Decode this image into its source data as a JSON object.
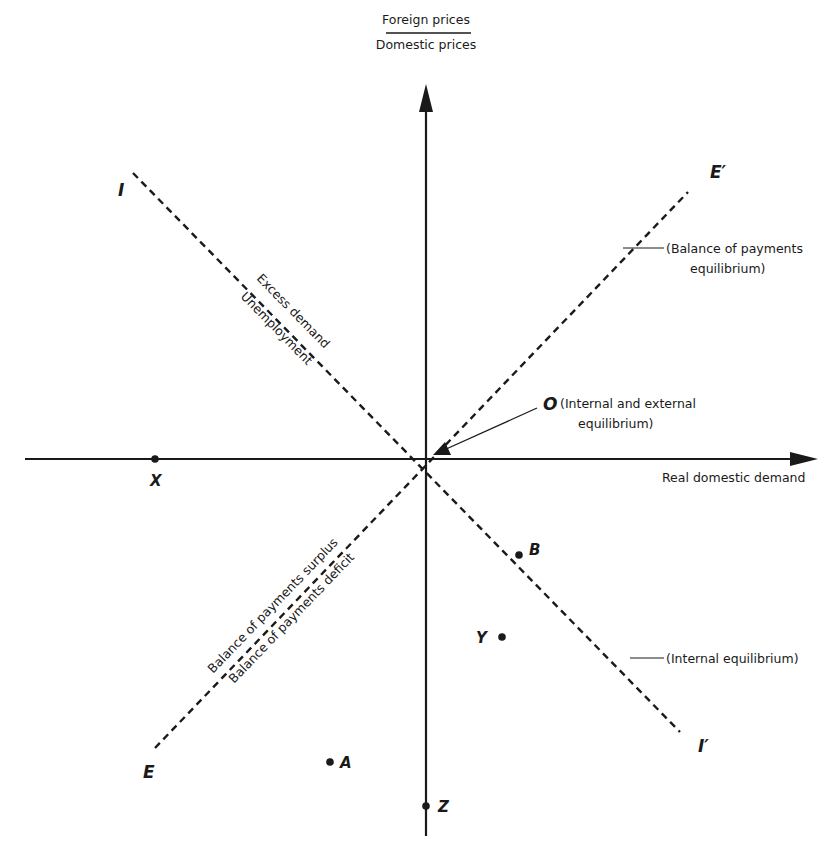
{
  "diagram": {
    "y_axis": {
      "numerator": "Foreign prices",
      "denominator": "Domestic prices"
    },
    "x_axis": {
      "label": "Real domestic demand"
    },
    "lines": {
      "internal": {
        "start_label": "I",
        "end_label": "I′",
        "annotation": "(Internal equilibrium)",
        "above_label": "Excess demand",
        "below_label": "Unemployment"
      },
      "external": {
        "start_label": "E",
        "end_label": "E′",
        "annotation_line1": "(Balance of payments",
        "annotation_line2": "equilibrium)",
        "above_label": "Balance of payments surplus",
        "below_label": "Balance of payments deficit"
      }
    },
    "origin": {
      "label": "O",
      "annotation_line1": "(Internal and external",
      "annotation_line2": "equilibrium)"
    },
    "points": {
      "X": "X",
      "B": "B",
      "Y": "Y",
      "A": "A",
      "Z": "Z"
    }
  }
}
